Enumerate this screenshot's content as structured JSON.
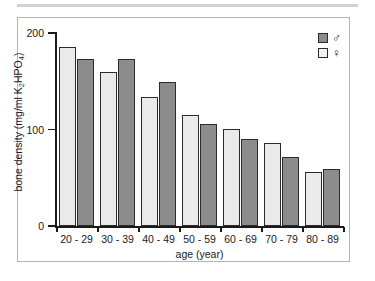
{
  "figure": {
    "frame_border_color": "#b4b4b4",
    "top_rule_color": "#d2d2d2"
  },
  "legend": {
    "entries": [
      {
        "label": "♂",
        "icon": "male-symbol",
        "color": "#8c8c8c",
        "series": "male"
      },
      {
        "label": "♀",
        "icon": "female-symbol",
        "color": "#f2f2f2",
        "series": "female"
      }
    ]
  },
  "axes": {
    "y_title_main": "bone density (mg/ml K",
    "y_title_sub": "2",
    "y_title_tail": "HPO",
    "y_title_sub2": "4",
    "y_title_close": ")",
    "y_ticks": [
      "0",
      "100",
      "200"
    ],
    "x_title": "age (year)"
  },
  "chart_data": {
    "type": "bar",
    "title": "",
    "xlabel": "age (year)",
    "ylabel": "bone density (mg/ml K2HPO4)",
    "categories": [
      "20 - 29",
      "30 - 39",
      "40 - 49",
      "50 - 59",
      "60 - 69",
      "70 - 79",
      "80 - 89"
    ],
    "series": [
      {
        "name": "♀",
        "key": "female",
        "color": "#eaeaea",
        "values": [
          185,
          160,
          134,
          115,
          101,
          86,
          56
        ]
      },
      {
        "name": "♂",
        "key": "male",
        "color": "#8c8c8c",
        "values": [
          173,
          173,
          149,
          106,
          90,
          72,
          59
        ]
      }
    ],
    "ylim": [
      0,
      200
    ],
    "yticks": [
      0,
      100,
      200
    ],
    "grid": false,
    "legend_position": "top-right"
  }
}
